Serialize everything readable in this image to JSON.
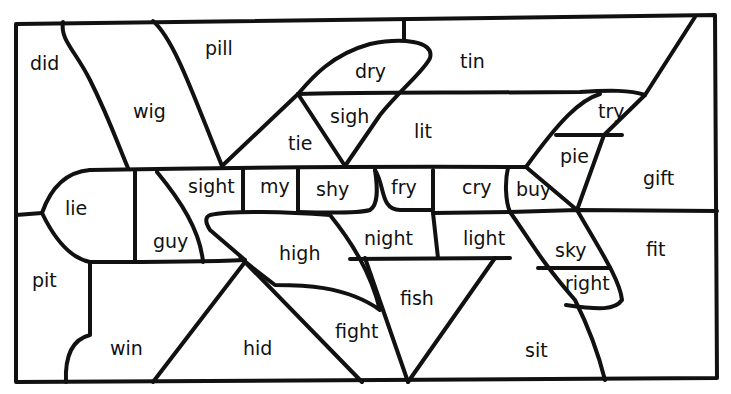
{
  "diagram": {
    "type": "color-by-word puzzle",
    "picture": "airplane",
    "regions": [
      {
        "id": "did",
        "word": "did"
      },
      {
        "id": "wig",
        "word": "wig"
      },
      {
        "id": "pill",
        "word": "pill"
      },
      {
        "id": "dry",
        "word": "dry"
      },
      {
        "id": "tin",
        "word": "tin"
      },
      {
        "id": "sigh",
        "word": "sigh"
      },
      {
        "id": "tie",
        "word": "tie"
      },
      {
        "id": "lit",
        "word": "lit"
      },
      {
        "id": "try",
        "word": "try"
      },
      {
        "id": "pie",
        "word": "pie"
      },
      {
        "id": "gift",
        "word": "gift"
      },
      {
        "id": "lie",
        "word": "lie"
      },
      {
        "id": "sight",
        "word": "sight"
      },
      {
        "id": "my",
        "word": "my"
      },
      {
        "id": "shy",
        "word": "shy"
      },
      {
        "id": "fry",
        "word": "fry"
      },
      {
        "id": "cry",
        "word": "cry"
      },
      {
        "id": "buy",
        "word": "buy"
      },
      {
        "id": "guy",
        "word": "guy"
      },
      {
        "id": "high",
        "word": "high"
      },
      {
        "id": "night",
        "word": "night"
      },
      {
        "id": "light",
        "word": "light"
      },
      {
        "id": "sky",
        "word": "sky"
      },
      {
        "id": "fit",
        "word": "fit"
      },
      {
        "id": "right",
        "word": "right"
      },
      {
        "id": "pit",
        "word": "pit"
      },
      {
        "id": "fish",
        "word": "fish"
      },
      {
        "id": "fight",
        "word": "fight"
      },
      {
        "id": "win",
        "word": "win"
      },
      {
        "id": "hid",
        "word": "hid"
      },
      {
        "id": "sit",
        "word": "sit"
      }
    ],
    "colors": {
      "line": "#111111",
      "background": "#ffffff"
    }
  }
}
